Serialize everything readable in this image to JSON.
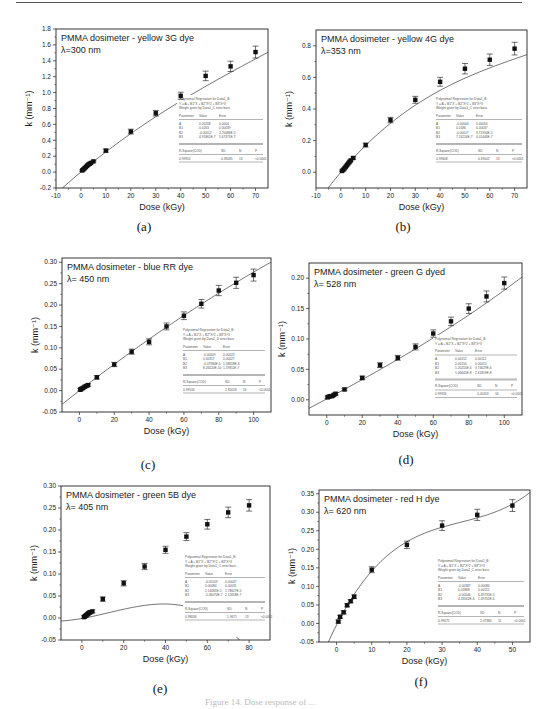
{
  "figure_caption": "Figure 14. Dose response of ...",
  "chart_data": [
    {
      "id": "a",
      "type": "scatter",
      "title": "PMMA dosimeter - yellow 3G dye",
      "subtitle": "λ=300 nm",
      "caption": "(a)",
      "xlabel": "Dose (kGy)",
      "ylabel": "k (mm⁻¹)",
      "xlim": [
        -10,
        75
      ],
      "ylim": [
        -0.2,
        1.8
      ],
      "xticks": [
        -10,
        0,
        10,
        20,
        30,
        40,
        50,
        60,
        70
      ],
      "yticks": [
        -0.2,
        0.0,
        0.2,
        0.4,
        0.6,
        0.8,
        1.0,
        1.2,
        1.4,
        1.6,
        1.8
      ],
      "ytick_decimals": 1,
      "grid": false,
      "points": [
        {
          "x": 0.5,
          "y": 0.02,
          "err": 0.01
        },
        {
          "x": 1,
          "y": 0.035,
          "err": 0.01
        },
        {
          "x": 1.5,
          "y": 0.05,
          "err": 0.01
        },
        {
          "x": 2,
          "y": 0.065,
          "err": 0.01
        },
        {
          "x": 2.5,
          "y": 0.08,
          "err": 0.01
        },
        {
          "x": 3,
          "y": 0.095,
          "err": 0.01
        },
        {
          "x": 3.5,
          "y": 0.105,
          "err": 0.01
        },
        {
          "x": 4,
          "y": 0.115,
          "err": 0.01
        },
        {
          "x": 5,
          "y": 0.135,
          "err": 0.01
        },
        {
          "x": 10,
          "y": 0.27,
          "err": 0.02
        },
        {
          "x": 20,
          "y": 0.51,
          "err": 0.03
        },
        {
          "x": 30,
          "y": 0.74,
          "err": 0.035
        },
        {
          "x": 40,
          "y": 0.96,
          "err": 0.045
        },
        {
          "x": 50,
          "y": 1.21,
          "err": 0.06
        },
        {
          "x": 60,
          "y": 1.33,
          "err": 0.065
        },
        {
          "x": 70,
          "y": 1.51,
          "err": 0.075
        }
      ],
      "fit": {
        "A": 0.00208,
        "B1": 0.0263,
        "B2": -0.00012,
        "B3": 4.91861e-07
      },
      "stats": {
        "header": [
          "Polynomial Regression for Data1_B:",
          "Y = A + B1*X + B2*X^2 + B3*X^3",
          "Weight given by Data1_C error bars."
        ],
        "columns": [
          "Parameter",
          "Value",
          "Error"
        ],
        "rows": [
          [
            "A",
            "0.00208",
            "0.0004"
          ],
          [
            "B1",
            "0.0263",
            "0.00039"
          ],
          [
            "B2",
            "-0.00012",
            "2.70086E-5"
          ],
          [
            "B3",
            "4.91861E-7",
            "5.67371E-7"
          ]
        ],
        "summary_columns": [
          "R-Square(COD)",
          "SD",
          "N",
          "P"
        ],
        "summary_values": [
          "0.99952",
          "0.39035",
          "13",
          "<0.0001"
        ]
      }
    },
    {
      "id": "b",
      "type": "scatter",
      "title": "PMMA dosimeter - yellow 4G dye",
      "subtitle": "λ=353 nm",
      "caption": "(b)",
      "xlabel": "Dose (kGy)",
      "ylabel": "k (mm⁻¹)",
      "xlim": [
        -10,
        75
      ],
      "ylim": [
        -0.1,
        0.9
      ],
      "xticks": [
        -10,
        0,
        10,
        20,
        30,
        40,
        50,
        60,
        70
      ],
      "yticks": [
        0.0,
        0.2,
        0.4,
        0.6,
        0.8
      ],
      "ytick_decimals": 1,
      "grid": false,
      "points": [
        {
          "x": 0.5,
          "y": 0.008,
          "err": 0.005
        },
        {
          "x": 1,
          "y": 0.015,
          "err": 0.005
        },
        {
          "x": 1.5,
          "y": 0.025,
          "err": 0.005
        },
        {
          "x": 2,
          "y": 0.035,
          "err": 0.005
        },
        {
          "x": 2.5,
          "y": 0.045,
          "err": 0.005
        },
        {
          "x": 3,
          "y": 0.055,
          "err": 0.005
        },
        {
          "x": 3.5,
          "y": 0.065,
          "err": 0.005
        },
        {
          "x": 4,
          "y": 0.075,
          "err": 0.005
        },
        {
          "x": 5,
          "y": 0.09,
          "err": 0.008
        },
        {
          "x": 10,
          "y": 0.172,
          "err": 0.012
        },
        {
          "x": 20,
          "y": 0.33,
          "err": 0.017
        },
        {
          "x": 30,
          "y": 0.458,
          "err": 0.022
        },
        {
          "x": 40,
          "y": 0.572,
          "err": 0.028
        },
        {
          "x": 50,
          "y": 0.655,
          "err": 0.033
        },
        {
          "x": 60,
          "y": 0.712,
          "err": 0.036
        },
        {
          "x": 70,
          "y": 0.782,
          "err": 0.04
        }
      ],
      "fit": {
        "A": -0.00044,
        "B1": 0.0186,
        "B2": -0.00017,
        "B3": 7.24216e-07
      },
      "stats": {
        "header": [
          "Polynomial Regression for Data1_B:",
          "Y = A + B1*X + B2*X^2 + B3*X^3",
          "Weight given by Data1_C error bars."
        ],
        "columns": [
          "Parameter",
          "Value",
          "Error"
        ],
        "rows": [
          [
            "A",
            "-0.00044",
            "0.00054"
          ],
          [
            "B1",
            "0.0186",
            "0.00037"
          ],
          [
            "B2",
            "-0.00017",
            "3.71900E-5"
          ],
          [
            "B3",
            "7.24216E-7",
            "4.01446E-7"
          ]
        ],
        "summary_columns": [
          "R-Square(COD)",
          "SD",
          "N",
          "P"
        ],
        "summary_values": [
          "0.99608",
          "0.69002",
          "13",
          "<0.0001"
        ]
      }
    },
    {
      "id": "c",
      "type": "scatter",
      "title": "PMMA dosimeter - blue RR dye",
      "subtitle": "λ= 450 nm",
      "caption": "(c)",
      "xlabel": "Dose (kGy)",
      "ylabel": "k (mm⁻¹)",
      "xlim": [
        -10,
        110
      ],
      "ylim": [
        -0.05,
        0.31
      ],
      "xticks": [
        0,
        20,
        40,
        60,
        80,
        100
      ],
      "yticks": [
        -0.05,
        0.0,
        0.05,
        0.1,
        0.15,
        0.2,
        0.25,
        0.3
      ],
      "ytick_decimals": 2,
      "grid": false,
      "points": [
        {
          "x": 0.5,
          "y": 0.002,
          "err": 0.003
        },
        {
          "x": 1,
          "y": 0.004,
          "err": 0.003
        },
        {
          "x": 2,
          "y": 0.006,
          "err": 0.003
        },
        {
          "x": 3,
          "y": 0.009,
          "err": 0.003
        },
        {
          "x": 4,
          "y": 0.011,
          "err": 0.003
        },
        {
          "x": 5,
          "y": 0.013,
          "err": 0.003
        },
        {
          "x": 10,
          "y": 0.031,
          "err": 0.004
        },
        {
          "x": 20,
          "y": 0.061,
          "err": 0.005
        },
        {
          "x": 30,
          "y": 0.091,
          "err": 0.006
        },
        {
          "x": 40,
          "y": 0.114,
          "err": 0.007
        },
        {
          "x": 50,
          "y": 0.15,
          "err": 0.008
        },
        {
          "x": 60,
          "y": 0.175,
          "err": 0.009
        },
        {
          "x": 70,
          "y": 0.203,
          "err": 0.01
        },
        {
          "x": 80,
          "y": 0.234,
          "err": 0.012
        },
        {
          "x": 90,
          "y": 0.252,
          "err": 0.013
        },
        {
          "x": 100,
          "y": 0.27,
          "err": 0.014
        }
      ],
      "fit": {
        "A": -9e-05,
        "B1": 0.00317,
        "B2": -4.07984e-06,
        "B3": 8.2602e-10
      },
      "stats": {
        "header": [
          "Polynomial Regression for Data2_B:",
          "Y = A + B1*X + B2*X^2 + B3*X^3",
          "Weight given by Data2_D error bars."
        ],
        "columns": [
          "Parameter",
          "Value",
          "Error"
        ],
        "rows": [
          [
            "A",
            "-0.00009",
            "0.00023"
          ],
          [
            "B1",
            "0.00317",
            "0.00027"
          ],
          [
            "B2",
            "-4.07984E-6",
            "1.58658E-6"
          ],
          [
            "B3",
            "8.26020E-10",
            "1.37811E-7"
          ]
        ],
        "summary_columns": [
          "R-Square(COD)",
          "SD",
          "N",
          "P"
        ],
        "summary_values": [
          "0.99534",
          "2.85018",
          "16",
          "<0.0001"
        ]
      }
    },
    {
      "id": "d",
      "type": "scatter",
      "title": "PMMA dosimeter - green G dyed",
      "subtitle": "λ= 528 nm",
      "caption": "(d)",
      "xlabel": "Dose (kGy)",
      "ylabel": "k (mm⁻¹)",
      "xlim": [
        -10,
        110
      ],
      "ylim": [
        -0.025,
        0.225
      ],
      "xticks": [
        0,
        20,
        40,
        60,
        80,
        100
      ],
      "yticks": [
        0.0,
        0.05,
        0.1,
        0.15,
        0.2
      ],
      "ytick_decimals": 2,
      "grid": false,
      "points": [
        {
          "x": 0.5,
          "y": 0.004,
          "err": 0.002
        },
        {
          "x": 1,
          "y": 0.005,
          "err": 0.002
        },
        {
          "x": 2,
          "y": 0.006,
          "err": 0.002
        },
        {
          "x": 3,
          "y": 0.006,
          "err": 0.002
        },
        {
          "x": 4,
          "y": 0.008,
          "err": 0.002
        },
        {
          "x": 5,
          "y": 0.01,
          "err": 0.002
        },
        {
          "x": 10,
          "y": 0.017,
          "err": 0.002
        },
        {
          "x": 20,
          "y": 0.036,
          "err": 0.003
        },
        {
          "x": 30,
          "y": 0.057,
          "err": 0.004
        },
        {
          "x": 40,
          "y": 0.069,
          "err": 0.004
        },
        {
          "x": 50,
          "y": 0.087,
          "err": 0.005
        },
        {
          "x": 60,
          "y": 0.109,
          "err": 0.006
        },
        {
          "x": 70,
          "y": 0.129,
          "err": 0.007
        },
        {
          "x": 80,
          "y": 0.15,
          "err": 0.008
        },
        {
          "x": 90,
          "y": 0.17,
          "err": 0.009
        },
        {
          "x": 100,
          "y": 0.192,
          "err": 0.01
        }
      ],
      "fit": {
        "A": 0.00152,
        "B1": 0.00156,
        "B2": 1.2025e-06,
        "B3": 1.0664e-08
      },
      "stats": {
        "header": [
          "Polynomial Regression for Data1_B:",
          "Y = A + B1*X + B2*X^2 + B3*X^3"
        ],
        "columns": [
          "Parameter",
          "Value",
          "Error"
        ],
        "rows": [
          [
            "A",
            "0.00152",
            "0.00112"
          ],
          [
            "B1",
            "0.00156",
            "0.00015"
          ],
          [
            "B2",
            "1.20255E-6",
            "3.74629E-6"
          ],
          [
            "B3",
            "1.06641E-8",
            "2.61819E-8"
          ]
        ],
        "summary_columns": [
          "R-Square(COD)",
          "SD",
          "N",
          "P"
        ],
        "summary_values": [
          "0.99926",
          "0.00203",
          "16",
          "<0.0001"
        ]
      }
    },
    {
      "id": "e",
      "type": "scatter",
      "title": "PMMA dosimeter - green 5B dye",
      "subtitle": "λ= 405 nm",
      "caption": "(e)",
      "xlabel": "Dose (kGy)",
      "ylabel": "k (mm⁻¹)",
      "xlim": [
        -10,
        90
      ],
      "ylim": [
        -0.05,
        0.3
      ],
      "xticks": [
        0,
        20,
        40,
        60,
        80
      ],
      "yticks": [
        -0.05,
        0.0,
        0.05,
        0.1,
        0.15,
        0.2,
        0.25,
        0.3
      ],
      "ytick_decimals": 2,
      "grid": false,
      "points": [
        {
          "x": 1,
          "y": 0.002,
          "err": 0.003
        },
        {
          "x": 1.5,
          "y": 0.004,
          "err": 0.003
        },
        {
          "x": 2,
          "y": 0.006,
          "err": 0.003
        },
        {
          "x": 2.5,
          "y": 0.008,
          "err": 0.003
        },
        {
          "x": 3,
          "y": 0.01,
          "err": 0.003
        },
        {
          "x": 3.5,
          "y": 0.012,
          "err": 0.003
        },
        {
          "x": 4,
          "y": 0.013,
          "err": 0.003
        },
        {
          "x": 5,
          "y": 0.015,
          "err": 0.003
        },
        {
          "x": 10,
          "y": 0.043,
          "err": 0.005
        },
        {
          "x": 20,
          "y": 0.079,
          "err": 0.006
        },
        {
          "x": 30,
          "y": 0.117,
          "err": 0.007
        },
        {
          "x": 40,
          "y": 0.155,
          "err": 0.008
        },
        {
          "x": 50,
          "y": 0.185,
          "err": 0.009
        },
        {
          "x": 60,
          "y": 0.213,
          "err": 0.011
        },
        {
          "x": 70,
          "y": 0.24,
          "err": 0.012
        },
        {
          "x": 80,
          "y": 0.256,
          "err": 0.013
        }
      ],
      "fit": {
        "A": -0.00109,
        "B1": 0.00084,
        "B2": 2.14081e-05,
        "B3": -5.4607e-07
      },
      "stats": {
        "header": [
          "Polynomial Regression for Data1_B:",
          "Y = A + B1*X + B2*X^2 + B3*X^3",
          "Weight given by Data1_C error bars."
        ],
        "columns": [
          "Parameter",
          "Value",
          "Error"
        ],
        "rows": [
          [
            "A",
            "-0.00109",
            "0.00047"
          ],
          [
            "B1",
            "0.00084",
            "0.00031"
          ],
          [
            "B2",
            "2.14081E-5",
            "1.78627E-5"
          ],
          [
            "B3",
            "-5.46070E-7",
            "2.11818E-7"
          ]
        ],
        "summary_columns": [
          "R-Square(COD)",
          "SD",
          "N",
          "P"
        ],
        "summary_values": [
          "0.98036",
          "1.9671",
          "13",
          "<0.0001"
        ]
      }
    },
    {
      "id": "f",
      "type": "scatter",
      "title": "PMMA dosimeter - red H dye",
      "subtitle": "λ= 620 nm",
      "caption": "(f)",
      "xlabel": "Dose (kGy)",
      "ylabel": "k (mm⁻¹)",
      "xlim": [
        -5,
        55
      ],
      "ylim": [
        -0.05,
        0.36
      ],
      "xticks": [
        0,
        10,
        20,
        30,
        40,
        50
      ],
      "yticks": [
        -0.05,
        0.0,
        0.05,
        0.1,
        0.15,
        0.2,
        0.25,
        0.3,
        0.35
      ],
      "ytick_decimals": 2,
      "grid": false,
      "points": [
        {
          "x": 0.5,
          "y": 0.005,
          "err": 0.004
        },
        {
          "x": 1,
          "y": 0.018,
          "err": 0.004
        },
        {
          "x": 2,
          "y": 0.03,
          "err": 0.004
        },
        {
          "x": 3,
          "y": 0.049,
          "err": 0.004
        },
        {
          "x": 4,
          "y": 0.06,
          "err": 0.004
        },
        {
          "x": 5,
          "y": 0.072,
          "err": 0.005
        },
        {
          "x": 10,
          "y": 0.145,
          "err": 0.008
        },
        {
          "x": 20,
          "y": 0.212,
          "err": 0.01
        },
        {
          "x": 30,
          "y": 0.264,
          "err": 0.013
        },
        {
          "x": 40,
          "y": 0.293,
          "err": 0.015
        },
        {
          "x": 50,
          "y": 0.318,
          "err": 0.016
        }
      ],
      "fit": {
        "A": -0.00387,
        "B1": 0.01868,
        "B2": -0.00046,
        "B3": 4.33562e-06
      },
      "stats": {
        "header": [
          "Polynomial Regression for Data2_B:",
          "Y = A + B1*X + B2*X^2 + B3*X^3",
          "Weight given by Data2_C error bars."
        ],
        "columns": [
          "Parameter",
          "Value",
          "Error"
        ],
        "rows": [
          [
            "A",
            "-0.00387",
            "0.00084"
          ],
          [
            "B1",
            "0.01868",
            "0.00115"
          ],
          [
            "B2",
            "-0.00046",
            "6.49735E-5"
          ],
          [
            "B3",
            "4.33562E-6",
            "1.09701E-6"
          ]
        ],
        "summary_columns": [
          "R-Square(COD)",
          "SD",
          "N",
          "P"
        ],
        "summary_values": [
          "0.99575",
          "2.07384",
          "11",
          "<0.0001"
        ]
      }
    }
  ]
}
